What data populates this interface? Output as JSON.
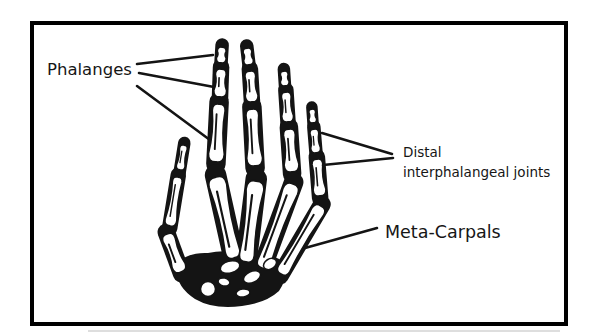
{
  "frame": {
    "border_color": "#000000"
  },
  "illustration": {
    "name": "skeletal-hand-dorsal-view",
    "ink_color": "#141414"
  },
  "labels": {
    "phalanges": "Phalanges",
    "distal_interphalangeal": {
      "line1": "Distal",
      "line2": "interphalangeal joints"
    },
    "meta_carpals": "Meta-Carpals"
  }
}
